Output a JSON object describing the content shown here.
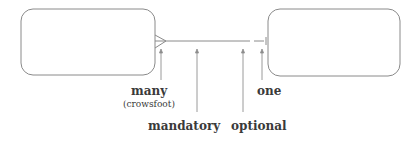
{
  "diagram": {
    "type": "ER relationship notation",
    "entities": [
      {
        "id": "left-entity",
        "label": ""
      },
      {
        "id": "right-entity",
        "label": ""
      }
    ],
    "relationship": {
      "left_end": "many (crowsfoot), mandatory",
      "right_end": "one, optional"
    },
    "labels": {
      "many": "many",
      "crowsfoot": "(crowsfoot)",
      "mandatory": "mandatory",
      "optional": "optional",
      "one": "one"
    },
    "colors": {
      "stroke": "#8a8a8a",
      "text": "#3a3a3a"
    }
  }
}
